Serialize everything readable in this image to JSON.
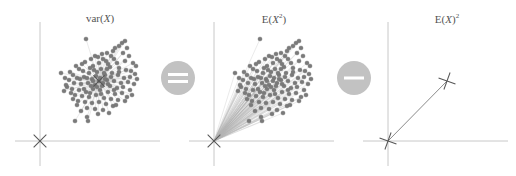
{
  "figure": {
    "colors": {
      "axis": "#c8c8c8",
      "point": "#7a7a7a",
      "point_stroke": "#6a6a6a",
      "ray": "#b4b4b4",
      "marker": "#555555",
      "operator_fill": "#c2c2c2",
      "operator_glyph": "#ffffff",
      "title": "#555555"
    },
    "operators": [
      {
        "name": "equals",
        "symbol": "=",
        "cx": 178,
        "cy": 78,
        "r": 17
      },
      {
        "name": "minus",
        "symbol": "-",
        "cx": 354,
        "cy": 78,
        "r": 17
      }
    ],
    "panels": [
      {
        "id": "variance",
        "title_html": "var(<i>X</i>)",
        "title_text": "var(X)",
        "title_x": 100,
        "origin": [
          40,
          141
        ],
        "h_axis": [
          15,
          160
        ],
        "v_axis": [
          22,
          166
        ],
        "cluster_center": [
          99,
          81
        ],
        "rays_from": "center",
        "show_points": true
      },
      {
        "id": "second_moment",
        "title_html": "E(<i>X</i><sup style=\"font-size:7px\">2</sup>)",
        "title_text": "E(X^2)",
        "title_x": 274,
        "origin": [
          214,
          141
        ],
        "h_axis": [
          189,
          334
        ],
        "v_axis": [
          22,
          166
        ],
        "cluster_center": [
          273,
          81
        ],
        "rays_from": "origin",
        "show_points": true
      },
      {
        "id": "squared_mean",
        "title_html": "E(<i>X</i>)<sup style=\"font-size:7px\">2</sup>",
        "title_text": "E(X)^2",
        "title_x": 447,
        "origin": [
          388,
          141
        ],
        "h_axis": [
          363,
          508
        ],
        "v_axis": [
          22,
          166
        ],
        "mean_marker": [
          447,
          81
        ],
        "show_points": false
      }
    ],
    "point_offsets": [
      [
        -13,
        -42
      ],
      [
        23,
        -38
      ],
      [
        26,
        -40
      ],
      [
        20,
        -35
      ],
      [
        16,
        -33
      ],
      [
        -4,
        -25
      ],
      [
        -1,
        -24
      ],
      [
        4,
        -22
      ],
      [
        7,
        -20
      ],
      [
        12,
        -25
      ],
      [
        15,
        -22
      ],
      [
        -8,
        -22
      ],
      [
        0,
        -18
      ],
      [
        9,
        -17
      ],
      [
        18,
        -18
      ],
      [
        26,
        -20
      ],
      [
        34,
        -18
      ],
      [
        30,
        -25
      ],
      [
        -14,
        -19
      ],
      [
        -6,
        -15
      ],
      [
        2,
        -12
      ],
      [
        11,
        -14
      ],
      [
        20,
        -13
      ],
      [
        27,
        -11
      ],
      [
        32,
        -10
      ],
      [
        -20,
        -12
      ],
      [
        -16,
        -10
      ],
      [
        -10,
        -8
      ],
      [
        -2,
        -9
      ],
      [
        6,
        -6
      ],
      [
        13,
        -8
      ],
      [
        19,
        -6
      ],
      [
        25,
        -3
      ],
      [
        31,
        -4
      ],
      [
        -26,
        -6
      ],
      [
        -22,
        -3
      ],
      [
        -15,
        -4
      ],
      [
        -7,
        -2
      ],
      [
        1,
        -3
      ],
      [
        8,
        -1
      ],
      [
        15,
        0
      ],
      [
        22,
        2
      ],
      [
        29,
        1
      ],
      [
        35,
        3
      ],
      [
        -30,
        -1
      ],
      [
        -25,
        2
      ],
      [
        -18,
        3
      ],
      [
        -11,
        2
      ],
      [
        -4,
        4
      ],
      [
        4,
        2
      ],
      [
        11,
        5
      ],
      [
        18,
        7
      ],
      [
        24,
        6
      ],
      [
        31,
        9
      ],
      [
        -32,
        6
      ],
      [
        -27,
        8
      ],
      [
        -20,
        9
      ],
      [
        -13,
        11
      ],
      [
        -6,
        8
      ],
      [
        1,
        9
      ],
      [
        9,
        11
      ],
      [
        16,
        13
      ],
      [
        23,
        12
      ],
      [
        28,
        16
      ],
      [
        -24,
        14
      ],
      [
        -17,
        15
      ],
      [
        -10,
        16
      ],
      [
        -3,
        14
      ],
      [
        5,
        17
      ],
      [
        12,
        18
      ],
      [
        19,
        19
      ],
      [
        -21,
        20
      ],
      [
        -14,
        21
      ],
      [
        -7,
        22
      ],
      [
        0,
        21
      ],
      [
        7,
        23
      ],
      [
        14,
        25
      ],
      [
        -12,
        27
      ],
      [
        -4,
        28
      ],
      [
        4,
        29
      ],
      [
        10,
        32
      ],
      [
        -1,
        33
      ],
      [
        -18,
        30
      ],
      [
        -28,
        12
      ],
      [
        -33,
        4
      ],
      [
        -9,
        -13
      ],
      [
        3,
        -27
      ],
      [
        14,
        -30
      ],
      [
        24,
        -28
      ],
      [
        36,
        -7
      ],
      [
        -29,
        -9
      ],
      [
        -23,
        -15
      ],
      [
        -17,
        -17
      ],
      [
        8,
        -28
      ],
      [
        -35,
        10
      ],
      [
        -26,
        18
      ],
      [
        -22,
        24
      ],
      [
        17,
        24
      ],
      [
        26,
        20
      ],
      [
        33,
        14
      ],
      [
        38,
        -2
      ],
      [
        -3,
        -5
      ],
      [
        3,
        5
      ],
      [
        -6,
        0
      ],
      [
        6,
        -2
      ],
      [
        0,
        0
      ],
      [
        -2,
        6
      ],
      [
        5,
        -8
      ],
      [
        -8,
        5
      ],
      [
        9,
        3
      ],
      [
        -12,
        -3
      ],
      [
        12,
        -4
      ],
      [
        -5,
        -11
      ],
      [
        2,
        13
      ],
      [
        -15,
        8
      ],
      [
        15,
        9
      ],
      [
        -19,
        -2
      ],
      [
        20,
        -9
      ],
      [
        -9,
        12
      ],
      [
        8,
        -12
      ],
      [
        -24,
        40
      ],
      [
        -12,
        36
      ],
      [
        -11,
        40
      ],
      [
        -38,
        -8
      ],
      [
        -34,
        -3
      ],
      [
        28,
        -33
      ],
      [
        37,
        -15
      ]
    ]
  }
}
